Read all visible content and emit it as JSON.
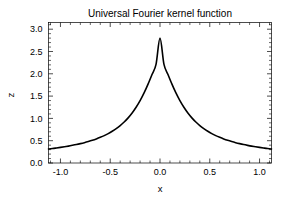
{
  "chart_data": {
    "type": "line",
    "title": "Universal Fourier kernel function",
    "xlabel": "x",
    "ylabel": "z",
    "xlim": [
      -1.12,
      1.12
    ],
    "ylim": [
      0.0,
      3.15
    ],
    "grid": false,
    "legend": null,
    "line_color": "#000000",
    "xticks": [
      -1.0,
      -0.5,
      0.0,
      0.5,
      1.0
    ],
    "xtick_labels": [
      "-1.0",
      "-0.5",
      "0.0",
      "0.5",
      "1.0"
    ],
    "yticks": [
      0.0,
      0.5,
      1.0,
      1.5,
      2.0,
      2.5,
      3.0
    ],
    "ytick_labels": [
      "0.0",
      "0.5",
      "1.0",
      "1.5",
      "2.0",
      "2.5",
      "3.0"
    ],
    "series": [
      {
        "name": "Universal Fourier kernel",
        "x": [
          -1.12,
          -1.08,
          -1.04,
          -1.0,
          -0.96,
          -0.92,
          -0.88,
          -0.84,
          -0.8,
          -0.76,
          -0.72,
          -0.68,
          -0.64,
          -0.6,
          -0.56,
          -0.52,
          -0.48,
          -0.44,
          -0.4,
          -0.36,
          -0.32,
          -0.28,
          -0.24,
          -0.2,
          -0.16,
          -0.12,
          -0.08,
          -0.04,
          0.0,
          0.04,
          0.08,
          0.12,
          0.16,
          0.2,
          0.24,
          0.28,
          0.32,
          0.36,
          0.4,
          0.44,
          0.48,
          0.52,
          0.56,
          0.6,
          0.64,
          0.68,
          0.72,
          0.76,
          0.8,
          0.84,
          0.88,
          0.92,
          0.96,
          1.0,
          1.04,
          1.08,
          1.12
        ],
        "y": [
          0.315,
          0.325,
          0.337,
          0.35,
          0.364,
          0.379,
          0.396,
          0.414,
          0.434,
          0.456,
          0.481,
          0.509,
          0.54,
          0.575,
          0.614,
          0.659,
          0.711,
          0.77,
          0.839,
          0.919,
          1.012,
          1.121,
          1.249,
          1.398,
          1.571,
          1.768,
          1.985,
          2.21,
          2.8,
          2.21,
          1.985,
          1.768,
          1.571,
          1.398,
          1.249,
          1.121,
          1.012,
          0.919,
          0.839,
          0.77,
          0.711,
          0.659,
          0.614,
          0.575,
          0.54,
          0.509,
          0.481,
          0.456,
          0.434,
          0.414,
          0.396,
          0.379,
          0.364,
          0.35,
          0.337,
          0.325,
          0.315
        ]
      }
    ],
    "peak": {
      "x": 0.0,
      "y": 2.8
    },
    "annotations": []
  }
}
